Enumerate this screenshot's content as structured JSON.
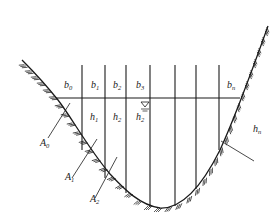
{
  "diagram": {
    "type": "channel-cross-section",
    "stroke_color": "#1a1a1a",
    "background": "#ffffff",
    "water_surface_symbol": "triangle-down-icon",
    "top_width_labels": [
      {
        "base": "b",
        "sub": "0"
      },
      {
        "base": "b",
        "sub": "1"
      },
      {
        "base": "b",
        "sub": "2"
      },
      {
        "base": "b",
        "sub": "3"
      },
      {
        "base": "b",
        "sub": "n"
      }
    ],
    "depth_labels": [
      {
        "base": "h",
        "sub": "1"
      },
      {
        "base": "h",
        "sub": "2"
      },
      {
        "base": "h",
        "sub": "2"
      },
      {
        "base": "h",
        "sub": "n"
      }
    ],
    "area_labels": [
      {
        "base": "A",
        "sub": "0"
      },
      {
        "base": "A",
        "sub": "1"
      },
      {
        "base": "A",
        "sub": "2"
      }
    ]
  }
}
